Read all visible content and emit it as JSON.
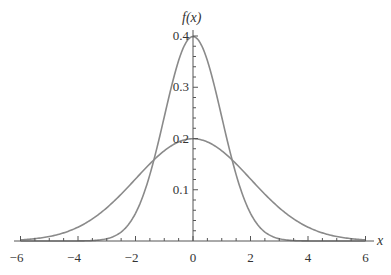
{
  "chart_data": {
    "type": "line",
    "title": "",
    "xlabel": "x",
    "ylabel": "f(x)",
    "xlim": [
      -6,
      6
    ],
    "ylim": [
      0,
      0.4
    ],
    "x_ticks": [
      -6,
      -4,
      -2,
      0,
      2,
      4,
      6
    ],
    "x_tick_labels": [
      "−6",
      "−4",
      "−2",
      "0",
      "2",
      "4",
      "6"
    ],
    "y_ticks": [
      0.1,
      0.2,
      0.3,
      0.4
    ],
    "y_tick_labels": [
      "0.1",
      "0.2",
      "0.3",
      "0.4"
    ],
    "grid": false,
    "legend": null,
    "series": [
      {
        "name": "Normal(0, 1) density",
        "mean": 0,
        "sd": 1,
        "peak": 0.399,
        "color": "#8a8a8a",
        "x": [
          -6,
          -4,
          -3,
          -2,
          -1.5,
          -1,
          -0.5,
          0,
          0.5,
          1,
          1.5,
          2,
          3,
          4,
          6
        ],
        "y": [
          0.0,
          0.0001,
          0.0044,
          0.054,
          0.1295,
          0.242,
          0.3521,
          0.3989,
          0.3521,
          0.242,
          0.1295,
          0.054,
          0.0044,
          0.0001,
          0.0
        ]
      },
      {
        "name": "Normal(0, 2) density",
        "mean": 0,
        "sd": 2,
        "peak": 0.1995,
        "color": "#8a8a8a",
        "x": [
          -6,
          -5,
          -4,
          -3,
          -2,
          -1,
          0,
          1,
          2,
          3,
          4,
          5,
          6
        ],
        "y": [
          0.0044,
          0.0088,
          0.027,
          0.0648,
          0.121,
          0.176,
          0.1995,
          0.176,
          0.121,
          0.0648,
          0.027,
          0.0088,
          0.0044
        ]
      }
    ]
  },
  "axes": {
    "x_label": "x",
    "y_label": "f(x)"
  }
}
